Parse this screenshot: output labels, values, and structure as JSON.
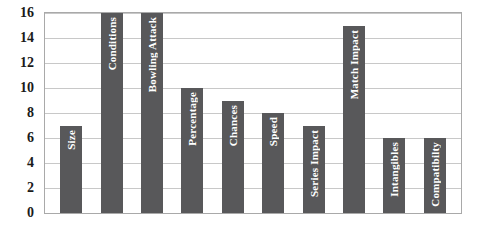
{
  "chart_data": {
    "type": "bar",
    "title": "",
    "subtitle": "",
    "xlabel": "",
    "ylabel": "",
    "ylim": [
      0,
      16
    ],
    "ytick_step": 2,
    "yticks": [
      "16",
      "14",
      "12",
      "10",
      "8",
      "6",
      "4",
      "2",
      "0"
    ],
    "grid": true,
    "legend": "none",
    "orientation": "vertical",
    "bar_label_placement": "inside-rotated",
    "categories": [
      "Size",
      "Conditions",
      "Bowling Attack",
      "Percentage",
      "Chances",
      "Speed",
      "Series Impact",
      "Match Impact",
      "Intangibles",
      "Compatibilty"
    ],
    "values": [
      7,
      16,
      16,
      10,
      9,
      8,
      7,
      15,
      6,
      6
    ],
    "series": [
      {
        "name": "",
        "values": [
          7,
          16,
          16,
          10,
          9,
          8,
          7,
          15,
          6,
          6
        ]
      }
    ]
  },
  "colors": {
    "bar_fill": "#58585a",
    "bar_label_text": "#ffffff",
    "plot_background": "#ffffff",
    "plot_border": "#a9a9a9",
    "gridline": "#c8c8c8",
    "axis_text": "#1a1a1a",
    "page_background": "#ffffff"
  }
}
